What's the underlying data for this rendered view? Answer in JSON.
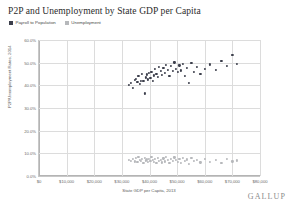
{
  "chart_data": {
    "type": "scatter",
    "title": "P2P and Unemployment by State GDP per Capita",
    "xlabel": "State GDP per Capita, 2013",
    "ylabel": "P2P/Unemployment Rates, 2014",
    "xlim": [
      0,
      80000
    ],
    "ylim": [
      0,
      60
    ],
    "grid": true,
    "legend_position": "top-left",
    "xticks": [
      "$0",
      "$10,000",
      "$20,000",
      "$30,000",
      "$40,000",
      "$50,000",
      "$60,000",
      "$70,000",
      "$80,000"
    ],
    "xtick_values": [
      0,
      10000,
      20000,
      30000,
      40000,
      50000,
      60000,
      70000,
      80000
    ],
    "yticks": [
      "0.0%",
      "10.0%",
      "20.0%",
      "30.0%",
      "40.0%",
      "50.0%",
      "60.0%"
    ],
    "ytick_values": [
      0,
      10,
      20,
      30,
      40,
      50,
      60
    ],
    "series": [
      {
        "name": "Payroll to Population",
        "color": "#3c3f4c",
        "points": [
          [
            32500,
            40.2
          ],
          [
            33200,
            41.1
          ],
          [
            34000,
            39.0
          ],
          [
            34600,
            42.3
          ],
          [
            35100,
            43.0
          ],
          [
            35600,
            41.4
          ],
          [
            36000,
            44.1
          ],
          [
            36400,
            40.6
          ],
          [
            36900,
            42.0
          ],
          [
            37300,
            45.2
          ],
          [
            37800,
            41.8
          ],
          [
            38200,
            36.4
          ],
          [
            38600,
            43.5
          ],
          [
            39000,
            44.8
          ],
          [
            39400,
            42.6
          ],
          [
            39900,
            45.6
          ],
          [
            40300,
            43.2
          ],
          [
            40700,
            46.0
          ],
          [
            41100,
            41.9
          ],
          [
            41600,
            44.4
          ],
          [
            42000,
            47.1
          ],
          [
            42500,
            45.0
          ],
          [
            43000,
            43.8
          ],
          [
            43500,
            48.0
          ],
          [
            44000,
            46.2
          ],
          [
            44500,
            44.6
          ],
          [
            45000,
            47.6
          ],
          [
            45500,
            45.4
          ],
          [
            46000,
            49.0
          ],
          [
            46600,
            46.8
          ],
          [
            47200,
            44.0
          ],
          [
            47800,
            48.4
          ],
          [
            48400,
            46.4
          ],
          [
            49000,
            50.1
          ],
          [
            49600,
            47.2
          ],
          [
            50200,
            45.8
          ],
          [
            50800,
            48.8
          ],
          [
            51500,
            46.6
          ],
          [
            52200,
            49.4
          ],
          [
            52900,
            44.2
          ],
          [
            53600,
            47.8
          ],
          [
            54400,
            41.2
          ],
          [
            55200,
            49.8
          ],
          [
            56000,
            46.0
          ],
          [
            57200,
            48.2
          ],
          [
            58400,
            44.9
          ],
          [
            60000,
            47.4
          ],
          [
            62000,
            49.2
          ],
          [
            64000,
            46.8
          ],
          [
            66000,
            50.6
          ],
          [
            68000,
            48.6
          ],
          [
            70000,
            53.4
          ],
          [
            71500,
            49.6
          ]
        ]
      },
      {
        "name": "Unemployment",
        "color": "#b6b8bb",
        "points": [
          [
            32500,
            7.2
          ],
          [
            33200,
            6.8
          ],
          [
            34000,
            7.6
          ],
          [
            34600,
            6.4
          ],
          [
            35100,
            7.9
          ],
          [
            35600,
            6.2
          ],
          [
            36000,
            8.3
          ],
          [
            36400,
            7.0
          ],
          [
            36900,
            6.6
          ],
          [
            37300,
            7.4
          ],
          [
            37800,
            5.9
          ],
          [
            38200,
            8.0
          ],
          [
            38600,
            6.9
          ],
          [
            39000,
            7.3
          ],
          [
            39400,
            6.1
          ],
          [
            39900,
            7.7
          ],
          [
            40300,
            6.5
          ],
          [
            40700,
            8.6
          ],
          [
            41100,
            7.1
          ],
          [
            41600,
            6.3
          ],
          [
            42000,
            7.5
          ],
          [
            42500,
            5.8
          ],
          [
            43000,
            8.1
          ],
          [
            43500,
            6.7
          ],
          [
            44000,
            7.2
          ],
          [
            44500,
            6.0
          ],
          [
            45000,
            7.8
          ],
          [
            45500,
            6.4
          ],
          [
            46000,
            8.4
          ],
          [
            46600,
            7.0
          ],
          [
            47200,
            5.7
          ],
          [
            47800,
            7.6
          ],
          [
            48400,
            6.6
          ],
          [
            49000,
            8.2
          ],
          [
            49600,
            7.1
          ],
          [
            50200,
            6.2
          ],
          [
            50800,
            7.4
          ],
          [
            51500,
            5.6
          ],
          [
            52200,
            7.9
          ],
          [
            52900,
            6.8
          ],
          [
            53600,
            7.3
          ],
          [
            54400,
            5.4
          ],
          [
            55200,
            8.0
          ],
          [
            56000,
            6.5
          ],
          [
            57200,
            7.2
          ],
          [
            58400,
            6.0
          ],
          [
            60000,
            7.5
          ],
          [
            62000,
            6.3
          ],
          [
            64000,
            7.0
          ],
          [
            66000,
            5.9
          ],
          [
            68000,
            7.7
          ],
          [
            70000,
            6.4
          ],
          [
            71500,
            6.9
          ]
        ]
      }
    ]
  },
  "brand": {
    "logo_text": "GALLUP"
  }
}
